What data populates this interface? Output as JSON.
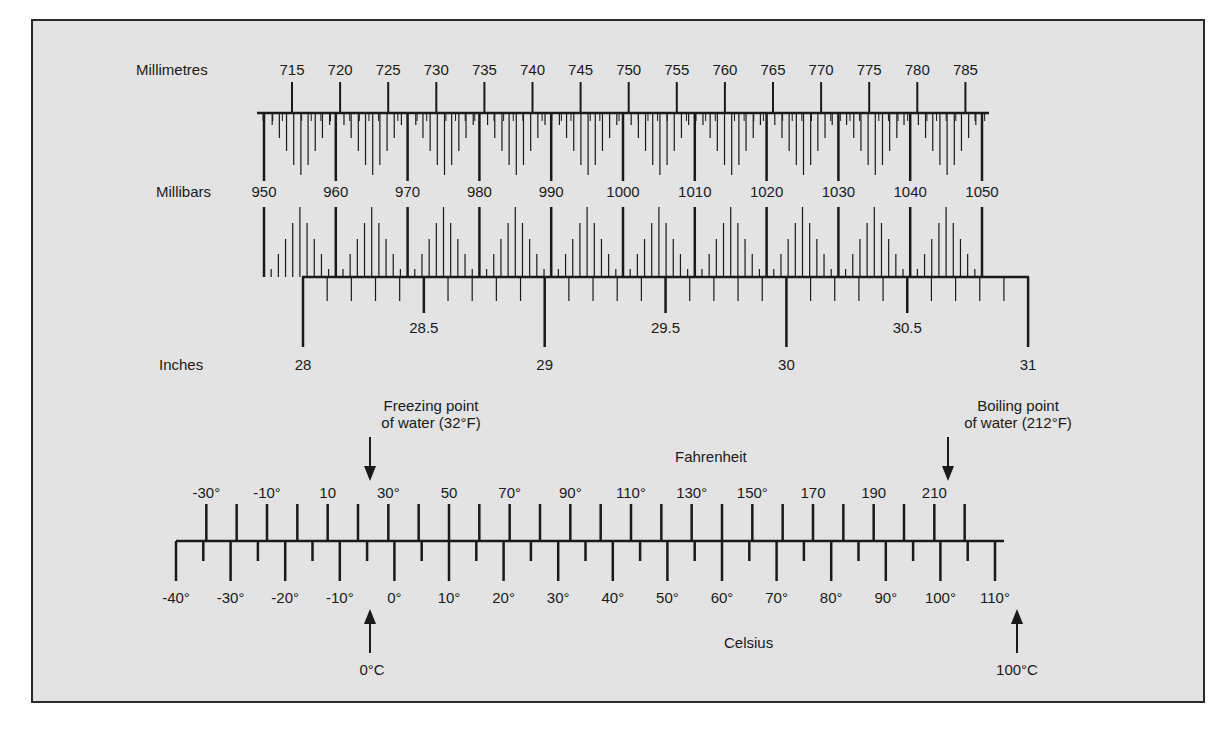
{
  "pressure": {
    "millimetres": {
      "name": "Millimetres",
      "labels": [
        "715",
        "720",
        "725",
        "730",
        "735",
        "740",
        "745",
        "750",
        "755",
        "760",
        "765",
        "770",
        "775",
        "780",
        "785"
      ]
    },
    "millibars": {
      "name": "Millibars",
      "labels": [
        "950",
        "960",
        "970",
        "980",
        "990",
        "1000",
        "1010",
        "1020",
        "1030",
        "1040",
        "1050"
      ]
    },
    "inches": {
      "name": "Inches",
      "major_labels": [
        "28",
        "29",
        "30",
        "31"
      ],
      "half_labels": [
        "28.5",
        "29.5",
        "30.5"
      ]
    }
  },
  "temperature": {
    "fahrenheit": {
      "name": "Fahrenheit",
      "labels": [
        "-30°",
        "-10°",
        "10",
        "30°",
        "50",
        "70°",
        "90°",
        "110°",
        "130°",
        "150°",
        "170",
        "190",
        "210"
      ]
    },
    "celsius": {
      "name": "Celsius",
      "labels": [
        "-40°",
        "-30°",
        "-20°",
        "-10°",
        "0°",
        "10°",
        "20°",
        "30°",
        "40°",
        "50°",
        "60°",
        "70°",
        "80°",
        "90°",
        "100°",
        "110°"
      ]
    },
    "annotations": {
      "freezing_line1": "Freezing point",
      "freezing_line2": "of water (32°F)",
      "boiling_line1": "Boiling point",
      "boiling_line2": "of water (212°F)",
      "zero_c": "0°C",
      "hundred_c": "100°C"
    }
  },
  "colors": {
    "panel_background": "#e3e3e3",
    "ink": "#1a1a1a"
  }
}
